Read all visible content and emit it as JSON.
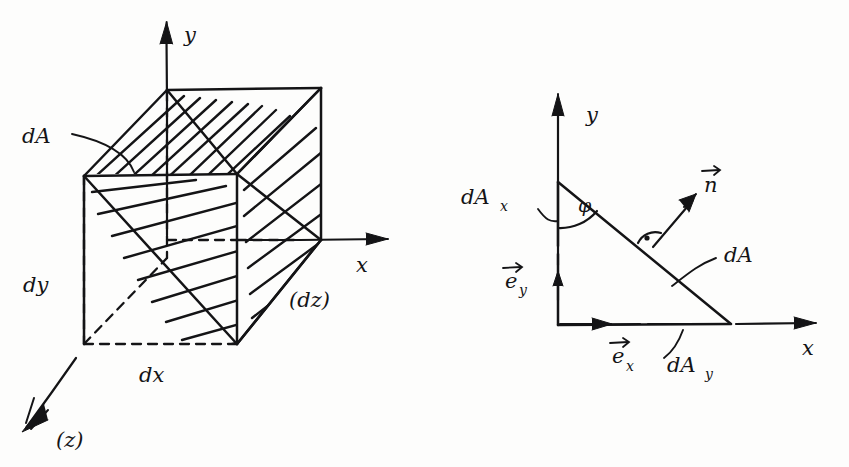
{
  "figure": {
    "ink_color": "#141416",
    "paper_color": "#fdfdfc"
  },
  "left_diagram": {
    "name": "cube-with-cut-plane",
    "axes": [
      {
        "id": "y",
        "label": "y",
        "direction": "up"
      },
      {
        "id": "x",
        "label": "x",
        "direction": "right"
      },
      {
        "id": "z",
        "label": "(z)",
        "direction": "lower-left"
      }
    ],
    "labels": [
      {
        "id": "dA",
        "text": "dA",
        "role": "cut-plane-area"
      },
      {
        "id": "dy",
        "text": "dy",
        "role": "edge-length-vertical"
      },
      {
        "id": "dx",
        "text": "dx",
        "role": "edge-length-horizontal"
      },
      {
        "id": "dz",
        "text": "(dz)",
        "role": "edge-length-depth"
      }
    ]
  },
  "right_diagram": {
    "name": "triangle-projection",
    "axes": [
      {
        "id": "y",
        "label": "y",
        "direction": "up"
      },
      {
        "id": "x",
        "label": "x",
        "direction": "right"
      }
    ],
    "labels": [
      {
        "id": "dAx",
        "text": "dA",
        "sub": "x",
        "role": "vertical-leg"
      },
      {
        "id": "dAy",
        "text": "dA",
        "sub": "y",
        "role": "horizontal-leg"
      },
      {
        "id": "dA",
        "text": "dA",
        "role": "hypotenuse"
      },
      {
        "id": "n",
        "text": "n",
        "role": "unit-normal-vector",
        "accent": "arrow"
      },
      {
        "id": "ey",
        "text": "e",
        "sub": "y",
        "role": "unit-vector-y",
        "accent": "arrow"
      },
      {
        "id": "ex",
        "text": "e",
        "sub": "x",
        "role": "unit-vector-x",
        "accent": "arrow"
      },
      {
        "id": "phi",
        "text": "φ",
        "role": "angle-between-y-axis-and-hypotenuse"
      },
      {
        "id": "rightangle",
        "text": "·",
        "role": "right-angle-marker-normal-to-dA"
      }
    ]
  }
}
